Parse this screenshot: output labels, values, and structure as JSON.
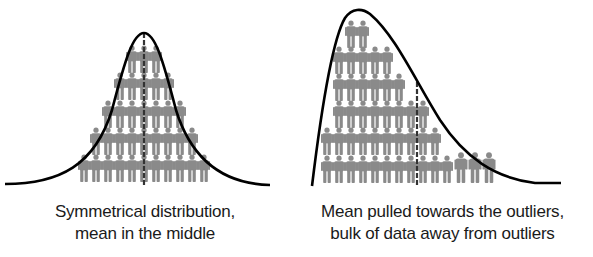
{
  "colors": {
    "curve": "#000000",
    "person": "#8a8a8a",
    "mean_line": "#333333",
    "background": "#ffffff",
    "caption_text": "#1a1a1a"
  },
  "panels": [
    {
      "id": "symmetric",
      "caption_line1": "Symmetrical distribution,",
      "caption_line2": "mean in the middle",
      "curve_path": "M5,184 C60,184 95,165 112,110 C125,60 133,33 144,33 C155,33 163,60 176,110 C193,165 228,184 270,185",
      "mean_line": {
        "x": 144,
        "y1": 33,
        "y2": 186
      },
      "person_rows": [
        {
          "count": 3,
          "start_x": 132,
          "spacing": 12,
          "bottom_y": 73
        },
        {
          "count": 5,
          "start_x": 120,
          "spacing": 12,
          "bottom_y": 100
        },
        {
          "count": 7,
          "start_x": 108,
          "spacing": 12,
          "bottom_y": 128
        },
        {
          "count": 9,
          "start_x": 96,
          "spacing": 12,
          "bottom_y": 155
        },
        {
          "count": 11,
          "start_x": 84,
          "spacing": 12,
          "bottom_y": 182
        }
      ]
    },
    {
      "id": "skewed",
      "caption_line1": "Mean pulled towards the outliers,",
      "caption_line2": "bulk of data away from outliers",
      "curve_path": "M312,186 C320,120 332,40 345,18 C352,8 362,8 370,14 C395,35 415,80 440,120 C465,158 495,178 535,183 L561,183",
      "mean_line": {
        "x": 417,
        "y1": 82,
        "y2": 186
      },
      "person_rows": [
        {
          "count": 2,
          "start_x": 351,
          "spacing": 12,
          "bottom_y": 48
        },
        {
          "count": 5,
          "start_x": 339,
          "spacing": 12,
          "bottom_y": 74
        },
        {
          "count": 6,
          "start_x": 339,
          "spacing": 12,
          "bottom_y": 101
        },
        {
          "count": 8,
          "start_x": 339,
          "spacing": 12,
          "bottom_y": 128
        },
        {
          "count": 10,
          "start_x": 327,
          "spacing": 12,
          "bottom_y": 155
        },
        {
          "count": 11,
          "start_x": 327,
          "spacing": 12,
          "bottom_y": 183
        },
        {
          "count": 3,
          "start_x": 461,
          "spacing": 14,
          "bottom_y": 183,
          "scale": 1.12
        }
      ]
    }
  ]
}
